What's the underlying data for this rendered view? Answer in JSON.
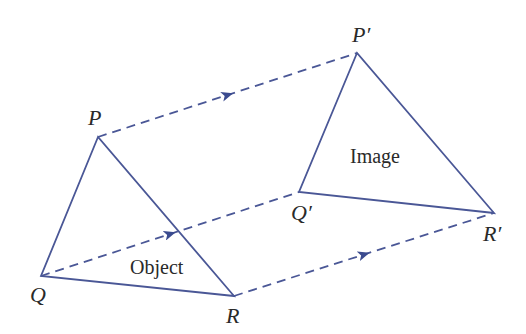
{
  "diagram": {
    "colors": {
      "line": "#4a5796",
      "arrow": "#3b4b8f",
      "text": "#2a2a2a",
      "background": "#ffffff"
    },
    "object": {
      "label": "Object",
      "vertices": {
        "P": [
          98,
          137
        ],
        "Q": [
          41,
          276
        ],
        "R": [
          234,
          296
        ]
      },
      "vertex_labels": {
        "P": "P",
        "Q": "Q",
        "R": "R"
      }
    },
    "image": {
      "label": "Image",
      "vertices": {
        "P'": [
          357,
          53
        ],
        "Q'": [
          299,
          192
        ],
        "R'": [
          494,
          213
        ]
      },
      "vertex_labels": {
        "P'": "P′",
        "Q'": "Q′",
        "R'": "R′"
      }
    },
    "translation_vectors": [
      {
        "from": "P",
        "to": "P'",
        "style": "dashed",
        "arrow": "mid"
      },
      {
        "from": "Q",
        "to": "Q'",
        "style": "dashed",
        "arrow": "mid"
      },
      {
        "from": "R",
        "to": "R'",
        "style": "dashed",
        "arrow": "mid"
      }
    ]
  }
}
